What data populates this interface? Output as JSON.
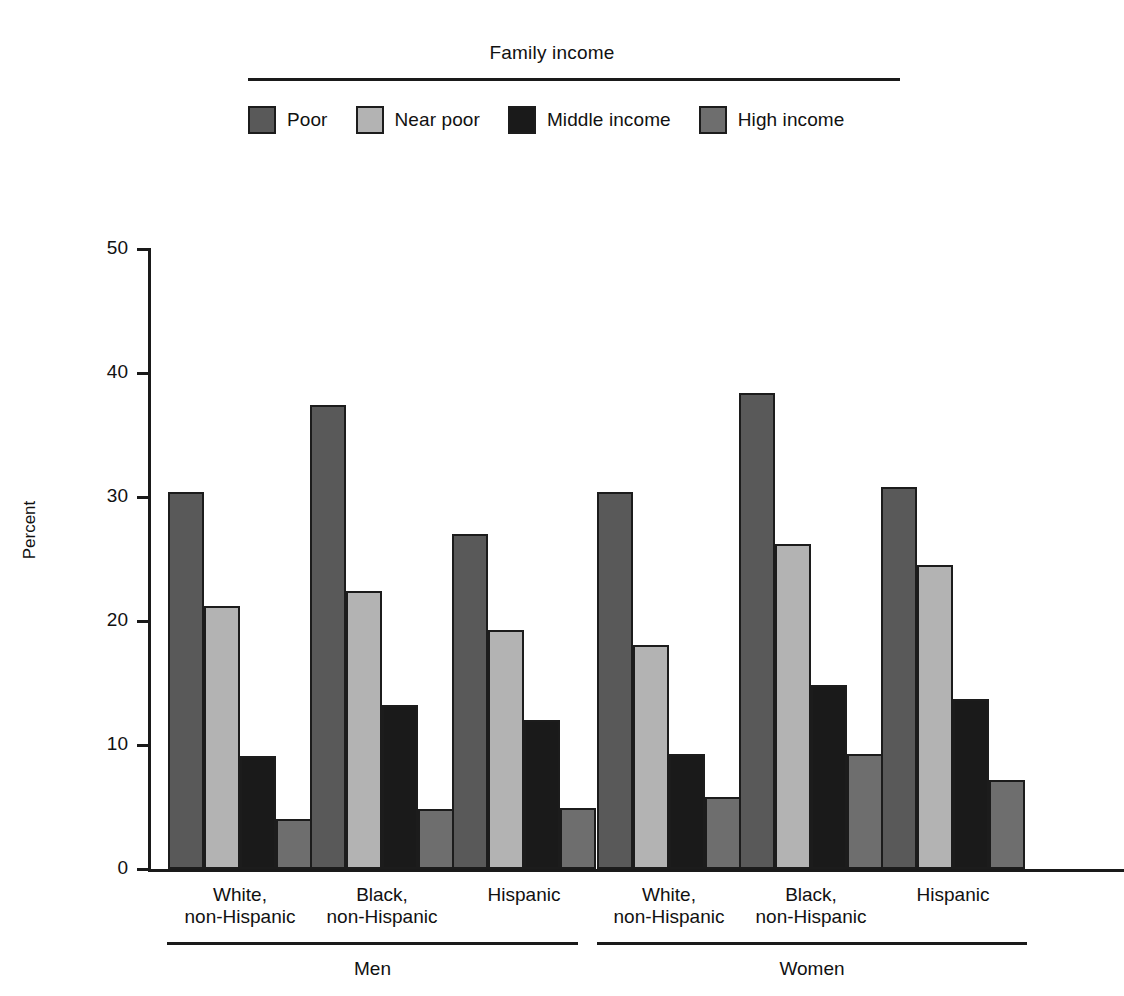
{
  "legend": {
    "title": "Family income",
    "entries": [
      {
        "label": "Poor",
        "color": "#595959"
      },
      {
        "label": "Near poor",
        "color": "#b3b3b3"
      },
      {
        "label": "Middle income",
        "color": "#1a1a1a"
      },
      {
        "label": "High income",
        "color": "#6e6e6e"
      }
    ]
  },
  "axes": {
    "ylabel": "Percent",
    "yticks": [
      "0",
      "10",
      "20",
      "30",
      "40",
      "50"
    ]
  },
  "groups": [
    {
      "label": "Men",
      "categories": [
        "White,\nnon-Hispanic",
        "Black,\nnon-Hispanic",
        "Hispanic"
      ]
    },
    {
      "label": "Women",
      "categories": [
        "White,\nnon-Hispanic",
        "Black,\nnon-Hispanic",
        "Hispanic"
      ]
    }
  ],
  "chart_data": {
    "type": "bar",
    "title": "",
    "xlabel": "",
    "ylabel": "Percent",
    "ylim": [
      0,
      50
    ],
    "ytick_step": 10,
    "grid": false,
    "legend_title": "Family income",
    "legend_position": "top",
    "categories": [
      "Men - White, non-Hispanic",
      "Men - Black, non-Hispanic",
      "Men - Hispanic",
      "Women - White, non-Hispanic",
      "Women - Black, non-Hispanic",
      "Women - Hispanic"
    ],
    "series": [
      {
        "name": "Poor",
        "color": "#595959",
        "values": [
          30.4,
          37.4,
          27.0,
          30.4,
          38.4,
          30.8
        ]
      },
      {
        "name": "Near poor",
        "color": "#b3b3b3",
        "values": [
          21.2,
          22.4,
          19.3,
          18.1,
          26.2,
          24.5
        ]
      },
      {
        "name": "Middle income",
        "color": "#1a1a1a",
        "values": [
          9.1,
          13.2,
          12.0,
          9.3,
          14.8,
          13.7
        ]
      },
      {
        "name": "High income",
        "color": "#6e6e6e",
        "values": [
          4.0,
          4.8,
          4.9,
          5.8,
          9.3,
          7.2
        ]
      }
    ]
  }
}
